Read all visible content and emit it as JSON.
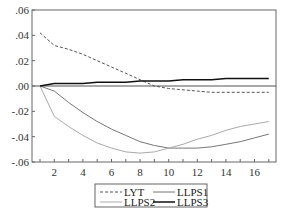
{
  "chart_data": {
    "type": "line",
    "title": "",
    "xlabel": "",
    "ylabel": "",
    "xlim": [
      1,
      17
    ],
    "ylim": [
      -0.06,
      0.06
    ],
    "grid": false,
    "zero_line": true,
    "legend_position": "bottom-center",
    "x": [
      1,
      2,
      3,
      4,
      5,
      6,
      7,
      8,
      9,
      10,
      11,
      12,
      13,
      14,
      15,
      16,
      17
    ],
    "x_tick_labels": [
      "2",
      "4",
      "6",
      "8",
      "10",
      "12",
      "14",
      "16"
    ],
    "y_tick_labels": [
      ".06",
      ".04",
      ".02",
      ".00",
      "-.02",
      "-.04",
      "-.06"
    ],
    "y_tick_values": [
      0.06,
      0.04,
      0.02,
      0.0,
      -0.02,
      -0.04,
      -0.06
    ],
    "series": [
      {
        "name": "LYT",
        "style": "dashed",
        "color": "#555555",
        "width": 1,
        "values": [
          0.042,
          0.032,
          0.029,
          0.025,
          0.02,
          0.015,
          0.01,
          0.005,
          0.0,
          -0.002,
          -0.003,
          -0.004,
          -0.005,
          -0.005,
          -0.005,
          -0.005,
          -0.005
        ]
      },
      {
        "name": "LLPS1",
        "style": "solid",
        "color": "#777777",
        "width": 1,
        "values": [
          0.0,
          -0.004,
          -0.013,
          -0.021,
          -0.028,
          -0.034,
          -0.039,
          -0.044,
          -0.047,
          -0.049,
          -0.049,
          -0.049,
          -0.048,
          -0.046,
          -0.044,
          -0.041,
          -0.038
        ]
      },
      {
        "name": "LLPS2",
        "style": "solid",
        "color": "#aaaaaa",
        "width": 1,
        "values": [
          0.0,
          -0.024,
          -0.032,
          -0.039,
          -0.045,
          -0.049,
          -0.052,
          -0.053,
          -0.052,
          -0.049,
          -0.046,
          -0.042,
          -0.039,
          -0.035,
          -0.032,
          -0.03,
          -0.028
        ]
      },
      {
        "name": "LLPS3",
        "style": "solid",
        "color": "#111111",
        "width": 1.5,
        "values": [
          0.0,
          0.002,
          0.002,
          0.002,
          0.003,
          0.003,
          0.003,
          0.004,
          0.004,
          0.004,
          0.005,
          0.005,
          0.005,
          0.006,
          0.006,
          0.006,
          0.006
        ]
      }
    ]
  },
  "legend": {
    "items": [
      {
        "label": "LYT"
      },
      {
        "label": "LLPS1"
      },
      {
        "label": "LLPS2"
      },
      {
        "label": "LLPS3"
      }
    ]
  }
}
